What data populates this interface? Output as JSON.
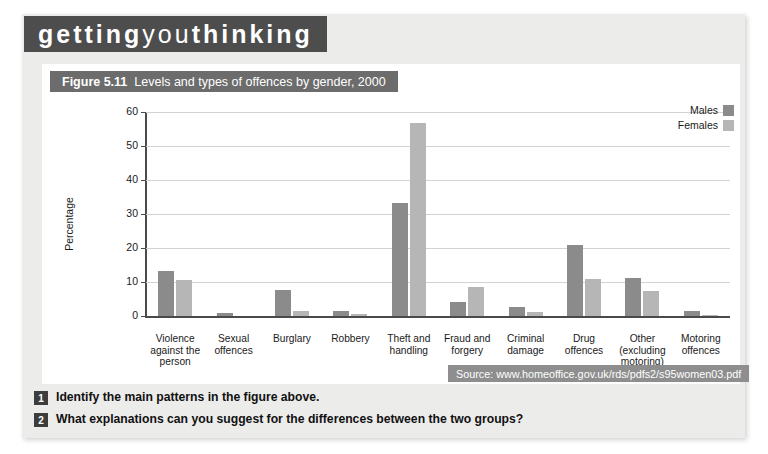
{
  "banner": {
    "part1": "getting",
    "part2": "you",
    "part3": "thinking"
  },
  "figure": {
    "number": "Figure 5.11",
    "caption": "Levels and types of offences by gender, 2000"
  },
  "source": {
    "text": "Source: www.homeoffice.gov.uk/rds/pdfs2/s95women03.pdf"
  },
  "questions": [
    {
      "number": "1",
      "text": "Identify the main patterns in the figure above."
    },
    {
      "number": "2",
      "text": "What explanations can you suggest for the differences between the two groups?"
    }
  ],
  "margin_note": {
    "text": "Crime and"
  },
  "colors": {
    "males_bar": "#8b8b8b",
    "females_bar": "#b6b6b6",
    "banner_bg": "#4d4d4d",
    "caption_bg": "#6c6c6c",
    "source_bg": "#8e8e8e",
    "panel_bg": "#ececeb",
    "grid": "#d2d2d2"
  },
  "chart_data": {
    "type": "bar",
    "title": "Levels and types of offences by gender, 2000",
    "xlabel": "",
    "ylabel": "Percentage",
    "ylim": [
      0,
      60
    ],
    "yticks": [
      0,
      10,
      20,
      30,
      40,
      50,
      60
    ],
    "grid": true,
    "legend_position": "top-right",
    "categories": [
      "Violence against the person",
      "Sexual offences",
      "Burglary",
      "Robbery",
      "Theft and handling",
      "Fraud and forgery",
      "Criminal damage",
      "Drug offences",
      "Other (excluding motoring)",
      "Motoring offences"
    ],
    "category_lines": [
      [
        "Violence",
        "against the",
        "person"
      ],
      [
        "Sexual",
        "offences"
      ],
      [
        "Burglary"
      ],
      [
        "Robbery"
      ],
      [
        "Theft and",
        "handling"
      ],
      [
        "Fraud and",
        "forgery"
      ],
      [
        "Criminal",
        "damage"
      ],
      [
        "Drug",
        "offences"
      ],
      [
        "Other",
        "(excluding",
        "motoring)"
      ],
      [
        "Motoring",
        "offences"
      ]
    ],
    "series": [
      {
        "name": "Males",
        "color": "#8b8b8b",
        "values": [
          13.2,
          0.9,
          7.7,
          1.6,
          33.2,
          4.0,
          2.7,
          21.0,
          11.3,
          1.6
        ]
      },
      {
        "name": "Females",
        "color": "#b6b6b6",
        "values": [
          10.7,
          0.0,
          1.5,
          0.6,
          56.7,
          8.5,
          1.3,
          10.8,
          7.3,
          0.4
        ]
      }
    ]
  }
}
